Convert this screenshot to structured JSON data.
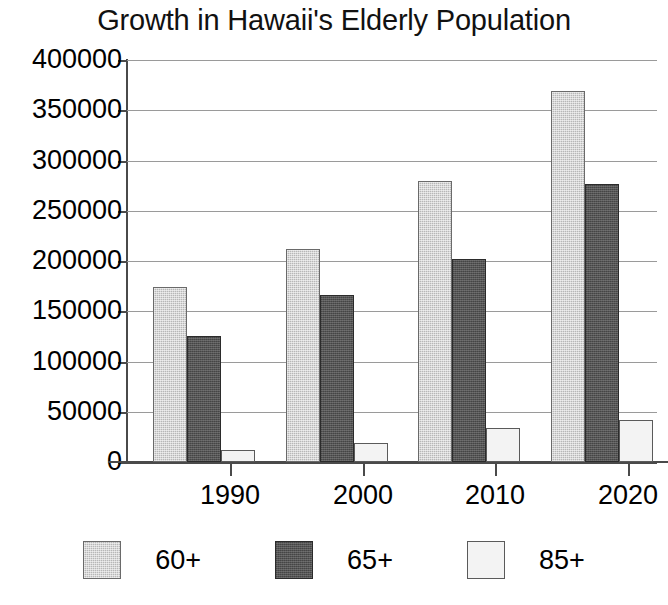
{
  "chart_data": {
    "type": "bar",
    "title": "Growth in Hawaii's Elderly Population",
    "xlabel": "",
    "ylabel": "",
    "categories": [
      "1990",
      "2000",
      "2010",
      "2020"
    ],
    "series": [
      {
        "name": "60+",
        "color": "#b7b7b7",
        "values": [
          174000,
          212000,
          280000,
          369000
        ]
      },
      {
        "name": "65+",
        "color": "#545454",
        "values": [
          125000,
          166000,
          202000,
          277000
        ]
      },
      {
        "name": "85+",
        "color": "#f3f3f3",
        "values": [
          12000,
          19000,
          34000,
          42000
        ]
      }
    ],
    "ylim": [
      0,
      400000
    ],
    "ytick_step": 50000,
    "ytick_labels": [
      "400000",
      "350000",
      "300000",
      "250000",
      "200000",
      "150000",
      "100000",
      "50000",
      "0"
    ],
    "ytick_values": [
      400000,
      350000,
      300000,
      250000,
      200000,
      150000,
      100000,
      50000,
      0
    ],
    "grid": true,
    "legend_position": "bottom",
    "legend_entries": [
      "60+",
      "65+",
      "85+"
    ]
  }
}
